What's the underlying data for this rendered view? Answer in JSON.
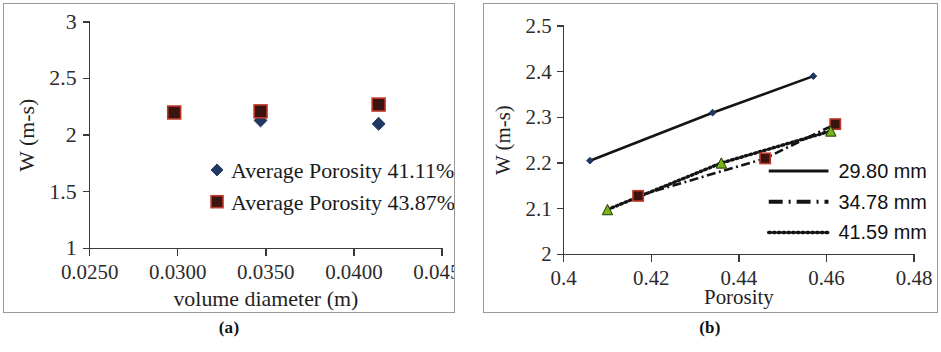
{
  "figure": {
    "caption_a": "(a)",
    "caption_b": "(b)"
  },
  "chart_data": [
    {
      "panel": "a",
      "type": "scatter",
      "title": "",
      "xlabel": "volume diameter (m)",
      "ylabel": "W (m-s)",
      "xlim": [
        0.025,
        0.045
      ],
      "ylim": [
        1,
        3
      ],
      "xticks": [
        0.025,
        0.03,
        0.035,
        0.04,
        0.045
      ],
      "xtick_labels": [
        "0.0250",
        "0.0300",
        "0.0350",
        "0.0400",
        "0.0450"
      ],
      "yticks": [
        1,
        1.5,
        2,
        2.5,
        3
      ],
      "ytick_labels": [
        "1",
        "1.5",
        "2",
        "2.5",
        "3"
      ],
      "grid": false,
      "legend_position": "center-right",
      "series": [
        {
          "name": "Average Porosity  41.11%",
          "marker": "diamond",
          "color": "#1f3864",
          "points": [
            {
              "x": 0.0347,
              "y": 2.13
            },
            {
              "x": 0.0414,
              "y": 2.1
            }
          ]
        },
        {
          "name": "Average Porosity  43.87%",
          "marker": "square",
          "color": "#c0392b",
          "points": [
            {
              "x": 0.0298,
              "y": 2.2
            },
            {
              "x": 0.0347,
              "y": 2.21
            },
            {
              "x": 0.0414,
              "y": 2.27
            }
          ]
        }
      ]
    },
    {
      "panel": "b",
      "type": "line",
      "title": "",
      "xlabel": "Porosity",
      "ylabel": "W (m-s)",
      "xlim": [
        0.4,
        0.48
      ],
      "ylim": [
        2,
        2.5
      ],
      "xticks": [
        0.4,
        0.42,
        0.44,
        0.46,
        0.48
      ],
      "xtick_labels": [
        "0.4",
        "0.42",
        "0.44",
        "0.46",
        "0.48"
      ],
      "yticks": [
        2,
        2.1,
        2.2,
        2.3,
        2.4,
        2.5
      ],
      "ytick_labels": [
        "2",
        "2.1",
        "2.2",
        "2.3",
        "2.4",
        "2.5"
      ],
      "grid": false,
      "legend_position": "lower-right",
      "series": [
        {
          "name": "29.80 mm",
          "dash": "solid",
          "marker": "diamond",
          "color": "#1f3864",
          "points": [
            {
              "x": 0.406,
              "y": 2.205
            },
            {
              "x": 0.434,
              "y": 2.31
            },
            {
              "x": 0.457,
              "y": 2.39
            }
          ]
        },
        {
          "name": "34.78 mm",
          "dash": "dashdot",
          "marker": "square",
          "color": "#c0392b",
          "points": [
            {
              "x": 0.417,
              "y": 2.128
            },
            {
              "x": 0.446,
              "y": 2.21
            },
            {
              "x": 0.462,
              "y": 2.285
            }
          ]
        },
        {
          "name": "41.59 mm",
          "dash": "dotted",
          "marker": "triangle",
          "color": "#7ab317",
          "points": [
            {
              "x": 0.41,
              "y": 2.098
            },
            {
              "x": 0.436,
              "y": 2.2
            },
            {
              "x": 0.461,
              "y": 2.27
            }
          ]
        }
      ]
    }
  ]
}
